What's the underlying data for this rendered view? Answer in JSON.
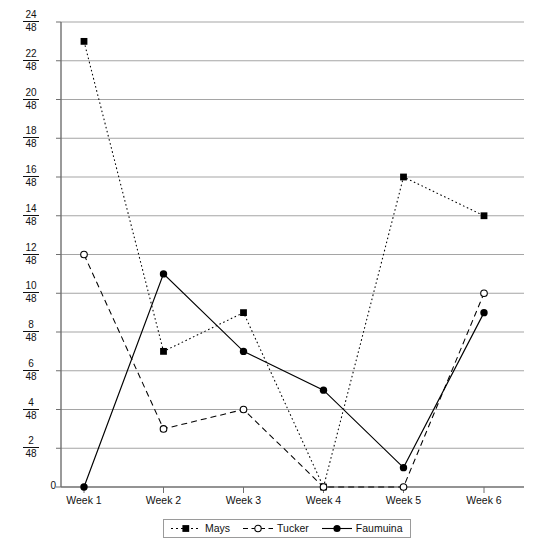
{
  "chart_data": {
    "type": "line",
    "title": "",
    "xlabel": "",
    "ylabel": "",
    "categories": [
      "Week 1",
      "Week 2",
      "Week 3",
      "Week 4",
      "Week 5",
      "Week 6"
    ],
    "ytick_labels": [
      "24/48",
      "22/48",
      "20/48",
      "18/48",
      "16/48",
      "14/48",
      "12/48",
      "10/48",
      "8/48",
      "6/48",
      "4/48",
      "2/48",
      "0"
    ],
    "ytick_values": [
      24,
      22,
      20,
      18,
      16,
      14,
      12,
      10,
      8,
      6,
      4,
      2,
      0
    ],
    "ytick_denominator": 48,
    "ylim": [
      0,
      24
    ],
    "grid": true,
    "legend_position": "bottom",
    "series": [
      {
        "name": "Mays",
        "marker": "filled-square",
        "line_style": "dotted",
        "color": "#000000",
        "values": [
          23,
          7,
          9,
          0,
          16,
          14
        ]
      },
      {
        "name": "Tucker",
        "marker": "open-circle",
        "line_style": "dashed",
        "color": "#000000",
        "values": [
          12,
          3,
          4,
          0,
          0,
          10
        ]
      },
      {
        "name": "Faumuina",
        "marker": "filled-circle",
        "line_style": "solid",
        "color": "#000000",
        "values": [
          0,
          11,
          7,
          5,
          1,
          9
        ]
      }
    ]
  },
  "legend": {
    "items": [
      {
        "label": "Mays",
        "icon": "filled-square-dotted-line-icon"
      },
      {
        "label": "Tucker",
        "icon": "open-circle-dashed-line-icon"
      },
      {
        "label": "Faumuina",
        "icon": "filled-circle-solid-line-icon"
      }
    ]
  },
  "axes": {
    "x_labels": [
      "Week 1",
      "Week 2",
      "Week 3",
      "Week 4",
      "Week 5",
      "Week 6"
    ],
    "y_labels": [
      {
        "num": "24",
        "den": "48"
      },
      {
        "num": "22",
        "den": "48"
      },
      {
        "num": "20",
        "den": "48"
      },
      {
        "num": "18",
        "den": "48"
      },
      {
        "num": "16",
        "den": "48"
      },
      {
        "num": "14",
        "den": "48"
      },
      {
        "num": "12",
        "den": "48"
      },
      {
        "num": "10",
        "den": "48"
      },
      {
        "num": "8",
        "den": "48"
      },
      {
        "num": "6",
        "den": "48"
      },
      {
        "num": "4",
        "den": "48"
      },
      {
        "num": "2",
        "den": "48"
      },
      {
        "zero": "0"
      }
    ]
  },
  "colors": {
    "gridline": "#9b9b9b",
    "axis": "#6f6f6f",
    "series": "#000000",
    "legend_border": "#9a9a9a"
  }
}
